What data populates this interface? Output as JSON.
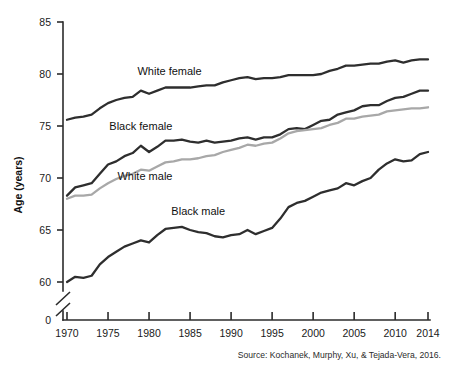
{
  "chart_data": {
    "type": "line",
    "title": "",
    "xlabel": "",
    "ylabel": "Age (years)",
    "xlim": [
      1970,
      2014
    ],
    "ylim": [
      58.5,
      85
    ],
    "y_axis_break": true,
    "y_break_label": "0",
    "grid": false,
    "legend": "inline-labels",
    "xticks": [
      1970,
      1975,
      1980,
      1985,
      1990,
      1995,
      2000,
      2005,
      2010,
      2014
    ],
    "yticks": [
      60,
      65,
      70,
      75,
      80,
      85
    ],
    "x": [
      1970,
      1971,
      1972,
      1973,
      1974,
      1975,
      1976,
      1977,
      1978,
      1979,
      1980,
      1981,
      1982,
      1983,
      1984,
      1985,
      1986,
      1987,
      1988,
      1989,
      1990,
      1991,
      1992,
      1993,
      1994,
      1995,
      1996,
      1997,
      1998,
      1999,
      2000,
      2001,
      2002,
      2003,
      2004,
      2005,
      2006,
      2007,
      2008,
      2009,
      2010,
      2011,
      2012,
      2013,
      2014
    ],
    "series": [
      {
        "name": "White female",
        "color": "#2e2e2e",
        "label_x": 1982.5,
        "label_y": 79.9,
        "values": [
          75.6,
          75.8,
          75.9,
          76.1,
          76.7,
          77.2,
          77.5,
          77.7,
          77.8,
          78.4,
          78.1,
          78.4,
          78.7,
          78.7,
          78.7,
          78.7,
          78.8,
          78.9,
          78.9,
          79.2,
          79.4,
          79.6,
          79.7,
          79.5,
          79.6,
          79.6,
          79.7,
          79.9,
          79.9,
          79.9,
          79.9,
          80.0,
          80.3,
          80.5,
          80.8,
          80.8,
          80.9,
          81.0,
          81.0,
          81.2,
          81.3,
          81.1,
          81.3,
          81.4,
          81.4
        ]
      },
      {
        "name": "Black female",
        "color": "#2e2e2e",
        "label_x": 1979.0,
        "label_y": 74.6,
        "values": [
          68.3,
          69.1,
          69.3,
          69.5,
          70.4,
          71.3,
          71.6,
          72.1,
          72.4,
          73.1,
          72.5,
          73.0,
          73.6,
          73.6,
          73.7,
          73.5,
          73.4,
          73.6,
          73.4,
          73.5,
          73.6,
          73.8,
          73.9,
          73.7,
          73.9,
          73.9,
          74.2,
          74.7,
          74.8,
          74.7,
          75.1,
          75.5,
          75.6,
          76.1,
          76.3,
          76.5,
          76.9,
          77.0,
          77.0,
          77.4,
          77.7,
          77.8,
          78.1,
          78.4,
          78.4
        ]
      },
      {
        "name": "White male",
        "color": "#a8a8a8",
        "label_x": 1979.5,
        "label_y": 69.8,
        "values": [
          68.0,
          68.3,
          68.3,
          68.4,
          69.0,
          69.5,
          69.9,
          70.2,
          70.4,
          70.8,
          70.7,
          71.1,
          71.5,
          71.6,
          71.8,
          71.8,
          71.9,
          72.1,
          72.2,
          72.5,
          72.7,
          72.9,
          73.2,
          73.1,
          73.3,
          73.4,
          73.8,
          74.3,
          74.5,
          74.6,
          74.7,
          74.8,
          75.1,
          75.3,
          75.7,
          75.7,
          75.9,
          76.0,
          76.1,
          76.4,
          76.5,
          76.6,
          76.7,
          76.7,
          76.8
        ]
      },
      {
        "name": "Black male",
        "color": "#2e2e2e",
        "label_x": 1986.0,
        "label_y": 66.4,
        "values": [
          60.0,
          60.5,
          60.4,
          60.6,
          61.7,
          62.4,
          62.9,
          63.4,
          63.7,
          64.0,
          63.8,
          64.5,
          65.1,
          65.2,
          65.3,
          65.0,
          64.8,
          64.7,
          64.4,
          64.3,
          64.5,
          64.6,
          65.0,
          64.6,
          64.9,
          65.2,
          66.1,
          67.2,
          67.6,
          67.8,
          68.2,
          68.6,
          68.8,
          69.0,
          69.5,
          69.3,
          69.7,
          70.0,
          70.8,
          71.4,
          71.8,
          71.6,
          71.7,
          72.3,
          72.5
        ]
      }
    ],
    "source": "Source: Kochanek, Murphy, Xu, & Tejada-Vera, 2016."
  }
}
